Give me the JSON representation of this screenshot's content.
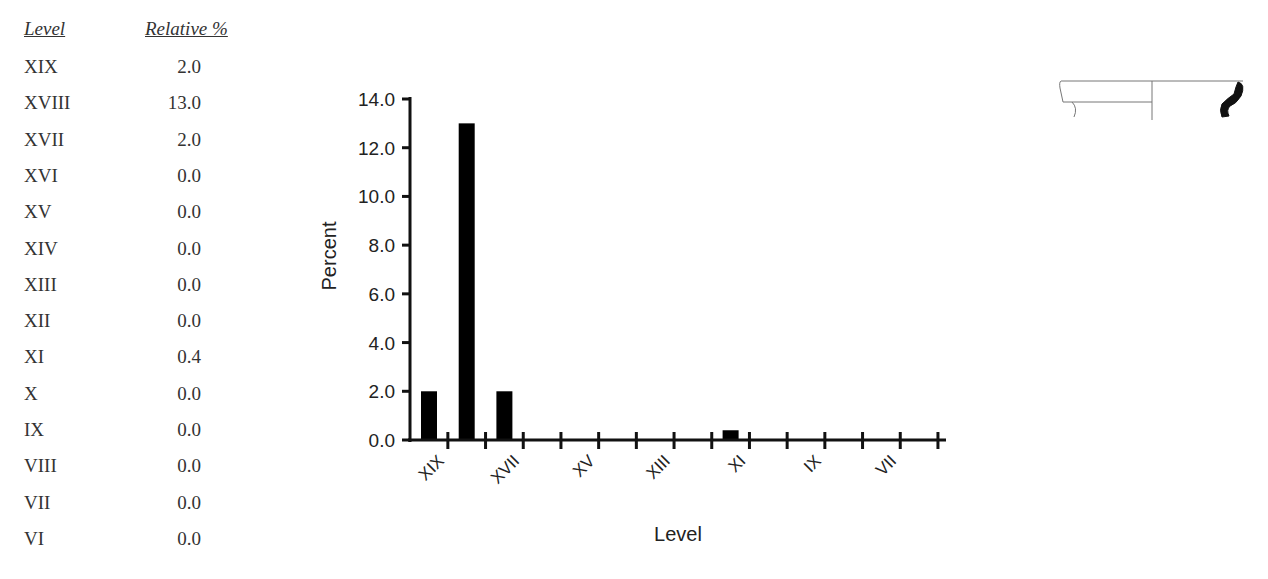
{
  "table": {
    "headers": {
      "level": "Level",
      "relative": "Relative %"
    },
    "rows": [
      {
        "level": "XIX",
        "value": "2.0"
      },
      {
        "level": "XVIII",
        "value": "13.0"
      },
      {
        "level": "XVII",
        "value": "2.0"
      },
      {
        "level": "XVI",
        "value": "0.0"
      },
      {
        "level": "XV",
        "value": "0.0"
      },
      {
        "level": "XIV",
        "value": "0.0"
      },
      {
        "level": "XIII",
        "value": "0.0"
      },
      {
        "level": "XII",
        "value": "0.0"
      },
      {
        "level": "XI",
        "value": "0.4"
      },
      {
        "level": "X",
        "value": "0.0"
      },
      {
        "level": "IX",
        "value": "0.0"
      },
      {
        "level": "VIII",
        "value": "0.0"
      },
      {
        "level": "VII",
        "value": "0.0"
      },
      {
        "level": "VI",
        "value": "0.0"
      }
    ]
  },
  "chart_data": {
    "type": "bar",
    "title": "",
    "xlabel": "Level",
    "ylabel": "Percent",
    "ylim": [
      0,
      14
    ],
    "yticks": [
      "0.0",
      "2.0",
      "4.0",
      "6.0",
      "8.0",
      "10.0",
      "12.0",
      "14.0"
    ],
    "categories": [
      "XIX",
      "XVIII",
      "XVII",
      "XVI",
      "XV",
      "XIV",
      "XIII",
      "XII",
      "XI",
      "X",
      "IX",
      "VIII",
      "VII",
      "VI"
    ],
    "values": [
      2.0,
      13.0,
      2.0,
      0.0,
      0.0,
      0.0,
      0.0,
      0.0,
      0.4,
      0.0,
      0.0,
      0.0,
      0.0,
      0.0
    ],
    "xtick_labels_shown": [
      "XIX",
      "XVII",
      "XV",
      "XIII",
      "XI",
      "IX",
      "VII"
    ],
    "bar_color": "#000000",
    "grid": false,
    "legend": null
  },
  "illustration": {
    "name": "vessel-profile-drawing"
  }
}
